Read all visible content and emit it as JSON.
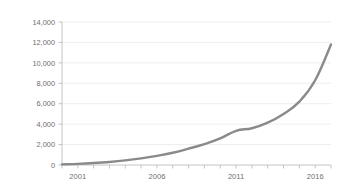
{
  "chart_data": {
    "type": "line",
    "title": "",
    "xlabel": "",
    "ylabel": "",
    "ylim": [
      0,
      14000
    ],
    "xlim": [
      2000,
      2017
    ],
    "grid": true,
    "legend": false,
    "legend_position": "none",
    "line_color": "#8a8a8a",
    "background_color": "#ffffff",
    "gridline_color": "#e9e9e9",
    "axis_color": "#bdbdbd",
    "ytick_labels": [
      "0",
      "2,000",
      "4,000",
      "6,000",
      "8,000",
      "10,000",
      "12,000",
      "14,000"
    ],
    "ytick_values": [
      0,
      2000,
      4000,
      6000,
      8000,
      10000,
      12000,
      14000
    ],
    "xtick_labels": [
      "2001",
      "2006",
      "2011",
      "2016"
    ],
    "xtick_values": [
      2001,
      2006,
      2011,
      2016
    ],
    "xminor_ticks": [
      2000,
      2001,
      2002,
      2003,
      2004,
      2005,
      2006,
      2007,
      2008,
      2009,
      2010,
      2011,
      2012,
      2013,
      2014,
      2015,
      2016,
      2017
    ],
    "x": [
      2000,
      2001,
      2002,
      2003,
      2004,
      2005,
      2006,
      2007,
      2008,
      2009,
      2010,
      2011,
      2012,
      2013,
      2014,
      2015,
      2016,
      2017
    ],
    "series": [
      {
        "name": "Total",
        "values": [
          60,
          110,
          190,
          300,
          450,
          650,
          900,
          1200,
          1600,
          2050,
          2600,
          3350,
          3600,
          4150,
          5000,
          6200,
          8300,
          11800
        ]
      }
    ]
  }
}
